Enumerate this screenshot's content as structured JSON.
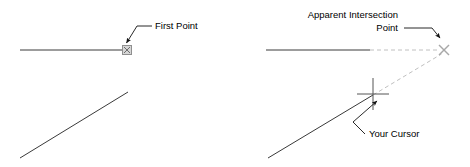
{
  "figure": {
    "background_color": "#ffffff",
    "width": 470,
    "height": 167,
    "stroke_color_solid": "#3a3a3a",
    "stroke_color_faint": "#bbbbbb",
    "leader_color": "#1a1a1a",
    "snap_marker_color": "#9a9a9a",
    "text_color": "#000000"
  },
  "panels": [
    {
      "id": "left-panel",
      "name": "first-point-panel",
      "labels": [
        {
          "id": "first-point-label",
          "text": "First Point",
          "x": 155,
          "y": 29,
          "align": "start"
        }
      ],
      "geometry": {
        "horizontal_line": {
          "x1": 20,
          "y1": 50,
          "x2": 124,
          "y2": 50
        },
        "diagonal_line": {
          "x1": 20,
          "y1": 158,
          "x2": 128,
          "y2": 92
        },
        "snap_marker": {
          "type": "apparent-intersection-square",
          "cx": 127,
          "cy": 50,
          "size": 9
        },
        "leader": {
          "points": "151,26 136,26 125,43",
          "arrow_at": "125,43"
        }
      }
    },
    {
      "id": "right-panel",
      "name": "apparent-intersection-panel",
      "labels": [
        {
          "id": "apparent-intersection-label-line1",
          "text": "Apparent Intersection",
          "x": 398,
          "y": 18,
          "align": "end"
        },
        {
          "id": "apparent-intersection-label-line2",
          "text": "Point",
          "x": 398,
          "y": 31,
          "align": "end"
        },
        {
          "id": "your-cursor-label",
          "text": "Your Cursor",
          "x": 367,
          "y": 137,
          "align": "start"
        }
      ],
      "geometry": {
        "horizontal_line": {
          "x1": 266,
          "y1": 50,
          "x2": 370,
          "y2": 50
        },
        "horizontal_extension_dashed": {
          "x1": 370,
          "y1": 50,
          "x2": 440,
          "y2": 50
        },
        "diagonal_line": {
          "x1": 268,
          "y1": 158,
          "x2": 373,
          "y2": 95
        },
        "diagonal_extension_dashed": {
          "x1": 373,
          "y1": 95,
          "x2": 441,
          "y2": 54
        },
        "intersection_marker": {
          "type": "x-cross",
          "cx": 444,
          "cy": 50,
          "size": 11
        },
        "cursor_crosshair": {
          "cx": 373,
          "cy": 94,
          "arm": 16
        },
        "leader_intersection": {
          "points": "403,28 432,28 441,38",
          "arrow_at": "441,38"
        },
        "leader_cursor": {
          "points": "364,134 352,122 378,100",
          "arrow_at": "378,100"
        }
      }
    }
  ],
  "icons": {
    "snap_marker_icon": "apparent-intersection-snap-square-icon",
    "x_marker_icon": "x-cross-marker-icon",
    "crosshair_icon": "crosshair-cursor-icon",
    "arrow_icon": "leader-arrowhead-icon"
  }
}
